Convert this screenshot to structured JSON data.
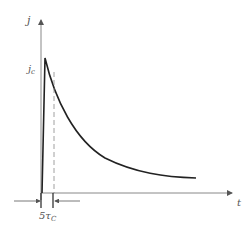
{
  "diagram": {
    "y_axis_label": "j",
    "x_axis_label": "t",
    "peak_label": "j",
    "peak_label_sub": "c",
    "interval_label": "5τ",
    "interval_label_sub": "C"
  },
  "colors": {
    "axis": "#777777",
    "curve": "#222222",
    "dashed": "#888888"
  }
}
